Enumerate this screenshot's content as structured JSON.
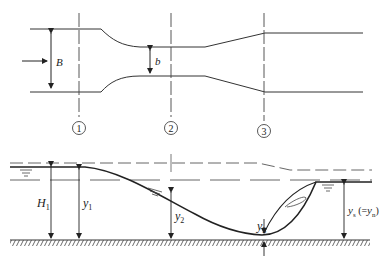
{
  "diagram": {
    "type": "open-channel contraction and hydraulic jump",
    "colors": {
      "line": "#333333",
      "background": "#ffffff"
    },
    "plan_view": {
      "labels": {
        "upstream_width": "B",
        "throat_width": "b"
      },
      "flow_arrow": "flow-direction-arrow"
    },
    "sections": [
      {
        "id": "1",
        "label": "1"
      },
      {
        "id": "2",
        "label": "2"
      },
      {
        "id": "3",
        "label": "3"
      }
    ],
    "profile_view": {
      "labels": {
        "total_head": "H",
        "total_head_sub": "1",
        "depth1": "y",
        "depth1_sub": "1",
        "depth2": "y",
        "depth2_sub": "2",
        "depth3": "y",
        "depth3_sub": "3",
        "depth_s": "y",
        "depth_s_sub": "s",
        "depth_s_note_prefix": " (=",
        "depth_s_note_y": "y",
        "depth_s_note_sub": "n",
        "depth_s_note_suffix": ")"
      }
    }
  }
}
